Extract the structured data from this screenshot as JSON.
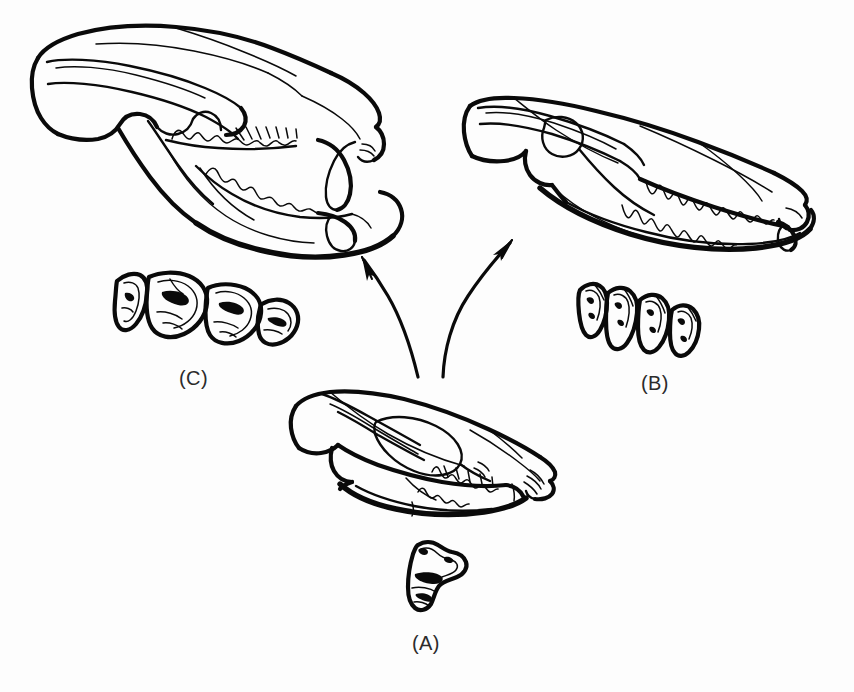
{
  "figure": {
    "background_color": "#fdfdfd",
    "ink_color": "#0a0a0a",
    "width": 854,
    "height": 692
  },
  "panels": [
    {
      "id": "A",
      "label": "(A)",
      "role": "ancestral-insectivore-skull",
      "skull_description": "Small generalized skull in left lateral view, centre-bottom of plate",
      "tooth_description": "Single isolated tribosphenic molar shown in occlusal view below the skull",
      "tooth_count": 1
    },
    {
      "id": "B",
      "label": "(B)",
      "role": "derived-carnivore-skull",
      "skull_description": "Elongate skull with long rostrum and sharp sectorial teeth, upper right of plate",
      "tooth_description": "Row of four sharp-cusped cheek teeth in occlusal view",
      "tooth_count": 4
    },
    {
      "id": "C",
      "label": "(C)",
      "role": "derived-herbivore-skull",
      "skull_description": "Short deep skull with broad zygomatic arch and enlarged incisor, upper left of plate",
      "tooth_description": "Row of four broad flattened cheek teeth in occlusal view",
      "tooth_count": 4
    }
  ],
  "arrows": [
    {
      "name": "arrow-a-to-c",
      "from_panel": "A",
      "to_panel": "C",
      "direction": "up-left",
      "style": "curved-solid-with-arrowhead"
    },
    {
      "name": "arrow-a-to-b",
      "from_panel": "A",
      "to_panel": "B",
      "direction": "up-right",
      "style": "curved-solid-with-arrowhead"
    }
  ]
}
